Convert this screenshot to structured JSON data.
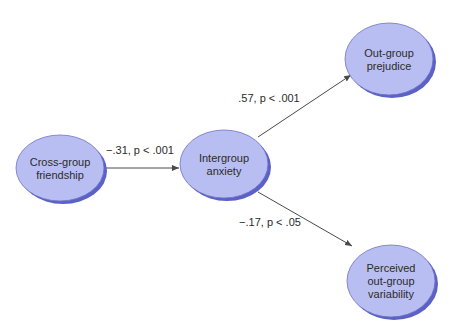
{
  "colors": {
    "node_fill": "#b9bef2",
    "node_stroke": "#6d72c4",
    "node_shadow": "#5b61c6",
    "edge": "#4a4a4a",
    "text": "#2b2b2b",
    "background": "#ffffff"
  },
  "nodes": [
    {
      "id": "friendship",
      "lines": [
        "Cross-group",
        "friendship"
      ],
      "cx": 60,
      "cy": 168,
      "rx": 44,
      "ry": 33
    },
    {
      "id": "anxiety",
      "lines": [
        "Intergroup",
        "anxiety"
      ],
      "cx": 224,
      "cy": 164,
      "rx": 44,
      "ry": 34
    },
    {
      "id": "prejudice",
      "lines": [
        "Out-group",
        "prejudice"
      ],
      "cx": 389,
      "cy": 59,
      "rx": 44,
      "ry": 36
    },
    {
      "id": "variability",
      "lines": [
        "Perceived",
        "out-group",
        "variability"
      ],
      "cx": 391,
      "cy": 281,
      "rx": 44,
      "ry": 36
    }
  ],
  "edges": [
    {
      "from": "friendship",
      "to": "anxiety",
      "label": "−.31, p < .001",
      "x1": 105,
      "y1": 168,
      "x2": 179,
      "y2": 168,
      "lx": 140,
      "ly": 154
    },
    {
      "from": "anxiety",
      "to": "prejudice",
      "label": ".57, p < .001",
      "x1": 258,
      "y1": 137,
      "x2": 351,
      "y2": 75,
      "lx": 269,
      "ly": 102
    },
    {
      "from": "anxiety",
      "to": "variability",
      "label": "−.17, p < .05",
      "x1": 258,
      "y1": 192,
      "x2": 352,
      "y2": 246,
      "lx": 270,
      "ly": 226
    }
  ]
}
